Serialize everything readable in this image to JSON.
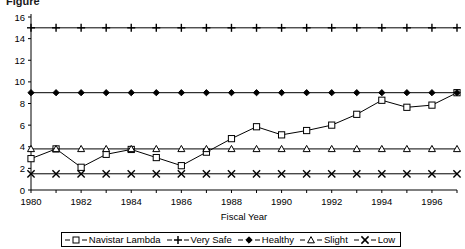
{
  "figure": {
    "title_partial": "Figure",
    "background": "#ffffff",
    "line_color": "#000000"
  },
  "axes": {
    "x_title": "Fiscal Year",
    "y_title": "",
    "y_ticks": [
      "0",
      "2",
      "4",
      "6",
      "8",
      "10",
      "12",
      "14",
      "16"
    ],
    "y_min": 0,
    "y_max": 16,
    "x_tick_labels": [
      "1980",
      "1982",
      "1984",
      "1986",
      "1988",
      "1990",
      "1992",
      "1994",
      "1996"
    ],
    "x_min": 1980,
    "x_max": 1997,
    "grid": "none"
  },
  "legend": {
    "position": "bottom",
    "entries": [
      {
        "label": "Navistar Lambda",
        "marker": "square"
      },
      {
        "label": "Very Safe",
        "marker": "plus"
      },
      {
        "label": "Healthy",
        "marker": "diamond"
      },
      {
        "label": "Slight",
        "marker": "triangle"
      },
      {
        "label": "Low",
        "marker": "x"
      }
    ]
  },
  "chart_data": {
    "type": "line",
    "title": "Figure",
    "xlabel": "Fiscal Year",
    "ylabel": "",
    "xlim": [
      1980,
      1997
    ],
    "ylim": [
      0,
      16
    ],
    "ytick_step": 2,
    "grid": false,
    "legend_position": "bottom",
    "x": [
      1980,
      1981,
      1982,
      1983,
      1984,
      1985,
      1986,
      1987,
      1988,
      1989,
      1990,
      1991,
      1992,
      1993,
      1994,
      1995,
      1996,
      1997
    ],
    "series": [
      {
        "name": "Navistar Lambda",
        "marker": "square",
        "values": [
          2.9,
          3.8,
          2.1,
          3.3,
          3.75,
          3.0,
          2.25,
          3.5,
          4.75,
          5.85,
          5.1,
          5.5,
          6.0,
          7.0,
          8.3,
          7.65,
          7.85,
          9.0
        ]
      },
      {
        "name": "Very Safe",
        "marker": "plus",
        "values": [
          15,
          15,
          15,
          15,
          15,
          15,
          15,
          15,
          15,
          15,
          15,
          15,
          15,
          15,
          15,
          15,
          15,
          15
        ]
      },
      {
        "name": "Healthy",
        "marker": "diamond",
        "values": [
          9,
          9,
          9,
          9,
          9,
          9,
          9,
          9,
          9,
          9,
          9,
          9,
          9,
          9,
          9,
          9,
          9,
          9
        ]
      },
      {
        "name": "Slight",
        "marker": "triangle",
        "values": [
          3.8,
          3.8,
          3.8,
          3.8,
          3.8,
          3.8,
          3.8,
          3.8,
          3.8,
          3.8,
          3.8,
          3.8,
          3.8,
          3.8,
          3.8,
          3.8,
          3.8,
          3.8
        ]
      },
      {
        "name": "Low",
        "marker": "x",
        "values": [
          1.5,
          1.5,
          1.5,
          1.5,
          1.5,
          1.5,
          1.5,
          1.5,
          1.5,
          1.5,
          1.5,
          1.5,
          1.5,
          1.5,
          1.5,
          1.5,
          1.5,
          1.5
        ]
      }
    ]
  }
}
